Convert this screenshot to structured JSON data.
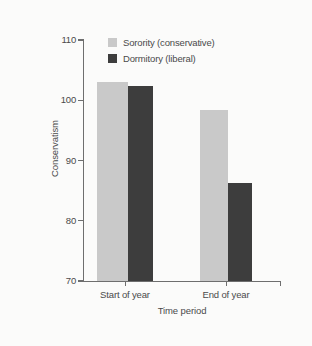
{
  "chart_data": {
    "type": "bar",
    "title": "",
    "xlabel": "Time period",
    "ylabel": "Conservatism",
    "categories": [
      "Start of year",
      "End of year"
    ],
    "series": [
      {
        "name": "Sorority (conservative)",
        "color": "#c9c9c9",
        "values": [
          103.0,
          98.4
        ]
      },
      {
        "name": "Dormitory (liberal)",
        "color": "#3d3d3d",
        "values": [
          102.3,
          86.3
        ]
      }
    ],
    "ylim": [
      70,
      110
    ],
    "yticks": [
      70,
      80,
      90,
      100,
      110
    ],
    "ytick_labels": [
      "70",
      "80",
      "90",
      "100",
      "110"
    ],
    "grid": false,
    "legend_position": "top-center"
  },
  "legend": {
    "items": [
      {
        "label": "Sorority (conservative)",
        "swatch": "#c9c9c9"
      },
      {
        "label": "Dormitory (liberal)",
        "swatch": "#3d3d3d"
      }
    ]
  },
  "colors": {
    "background": "#fbfbfa",
    "axis": "#6e6e6e",
    "text": "#4a4a4a",
    "series_light": "#c9c9c9",
    "series_dark": "#3d3d3d"
  }
}
